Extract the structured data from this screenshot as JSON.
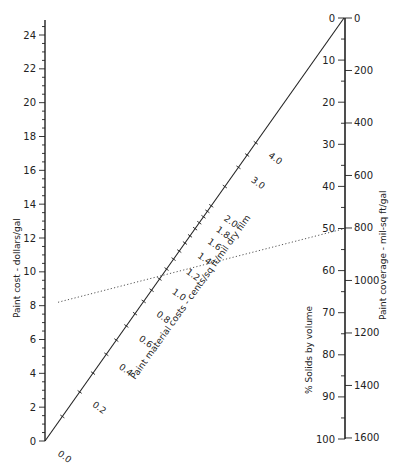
{
  "chart_data": {
    "type": "nomograph",
    "title": "",
    "left_axis": {
      "label": "Paint cost - dollars/gal",
      "range": [
        0,
        24
      ],
      "major_ticks": [
        0,
        2,
        4,
        6,
        8,
        10,
        12,
        14,
        16,
        18,
        20,
        22,
        24
      ],
      "minor_step": 0.5
    },
    "right_axis_inner": {
      "label": "% Solids by volume",
      "range": [
        0,
        100
      ],
      "major_ticks": [
        0,
        10,
        20,
        30,
        40,
        50,
        60,
        70,
        80,
        90,
        100
      ],
      "minor_step": 5
    },
    "right_axis_outer": {
      "label": "Paint coverage - mil-sq ft/gal",
      "range": [
        0,
        1600
      ],
      "major_ticks": [
        0,
        200,
        400,
        600,
        800,
        1000,
        1200,
        1400,
        1600
      ]
    },
    "diagonal_axis": {
      "label": "Paint material costs - cents/sq ft/mil dry film",
      "tick_labels": [
        "0.0",
        "0.2",
        "0.4",
        "0.6",
        "0.8",
        "1.0",
        "1.2",
        "1.4",
        "1.6",
        "1.8",
        "2.0",
        "3.0",
        "4.0"
      ]
    },
    "example_line": {
      "style": "dotted",
      "from": {
        "axis": "Paint cost",
        "value": 8.2
      },
      "to": {
        "axis": "% Solids by volume",
        "value": 50
      },
      "crosses_diagonal_at": 1.1
    }
  },
  "labels": {
    "left_axis": "Paint cost - dollars/gal",
    "solids_axis": "% Solids by volume",
    "coverage_axis": "Paint coverage - mil-sq ft/gal",
    "diagonal_axis": "Paint material costs - cents/sq ft/mil dry film"
  }
}
